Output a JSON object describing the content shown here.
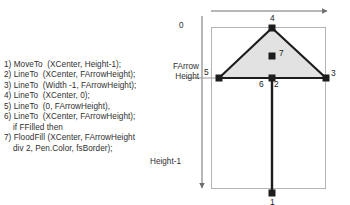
{
  "code": {
    "title": "arrow-drawing-steps",
    "lines": [
      {
        "text": "1) MoveTo  (XCenter, Height-1);",
        "indent": false
      },
      {
        "text": "2) LineTo  (XCenter, FArrowHeight);",
        "indent": false
      },
      {
        "text": "3) LineTo  (Width -1, FArrowHeight);",
        "indent": false
      },
      {
        "text": "4) LineTo  (XCenter, 0);",
        "indent": false
      },
      {
        "text": "5) LineTo  (0, FArrowHeight),",
        "indent": false
      },
      {
        "text": "6) LineTo  (XCenter, FArrowHeight);",
        "indent": false
      },
      {
        "text": "if FFilled then",
        "indent": true
      },
      {
        "text": "7) FloodFill (XCenter, FArrowHeight",
        "indent": false
      },
      {
        "text": "div 2, Pen.Color, fsBorder);",
        "indent": true
      }
    ]
  },
  "diagram": {
    "axis_labels": {
      "top_origin": "0",
      "farrow_height_line1": "FArrow",
      "farrow_height_line2": "Height",
      "height_minus_1": "Height-1"
    },
    "point_labels": {
      "apex": "4",
      "left_vertex": "5",
      "right_vertex": "3",
      "center_left": "6",
      "center_right": "2",
      "floodfill": "7",
      "bottom": "1"
    },
    "colors": {
      "triangle_fill": "#e2e2e2",
      "stroke": "#1d1d1d",
      "guide": "#9a9a9a",
      "rect_border": "#b4b4b4"
    }
  }
}
